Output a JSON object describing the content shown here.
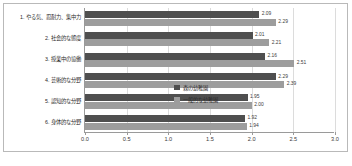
{
  "chart_data": {
    "type": "bar",
    "orientation": "horizontal",
    "title": "",
    "xlabel": "",
    "ylabel": "",
    "xlim": [
      0.0,
      3.0
    ],
    "xticks": [
      "0.0",
      "0.5",
      "1.0",
      "1.5",
      "2.0",
      "2.5",
      "3.0"
    ],
    "grid": true,
    "legend_position": "inside-lower-right",
    "categories": [
      "1. やる気、忍耐力、集中力",
      "2. 社会的な態度",
      "3. 授業中の協働",
      "4. 芸術的な分野",
      "5. 認知的な分野",
      "6. 身体的な分野"
    ],
    "series": [
      {
        "name": "森の幼稚園",
        "color": "#4f4f4f",
        "values": [
          2.09,
          2.01,
          2.16,
          2.29,
          1.95,
          1.92
        ],
        "labels": [
          "2.09",
          "2.01",
          "2.16",
          "2.29",
          "1.95",
          "1.92"
        ]
      },
      {
        "name": "一般的な幼稚園",
        "color": "#9d9d9d",
        "values": [
          2.29,
          2.21,
          2.51,
          2.39,
          2.0,
          1.94
        ],
        "labels": [
          "2.29",
          "2.21",
          "2.51",
          "2.39",
          "2.00",
          "1.94"
        ]
      }
    ]
  }
}
